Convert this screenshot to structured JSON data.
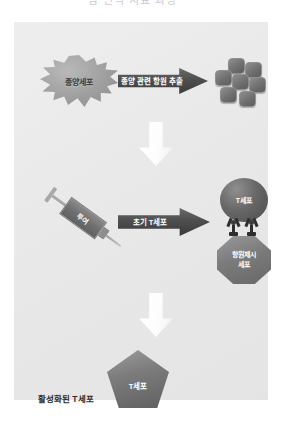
{
  "title_strip": {
    "text": "암 면역 치료 과정"
  },
  "diagram": {
    "stage1": {
      "tumor_cell_label": "종양세포",
      "arrow_label": "종양 관련 항원 추출",
      "antigen_cluster_name": "antigen-particles",
      "antigen_particle_count": 7
    },
    "connector1": {
      "icon": "down-arrow-icon"
    },
    "stage2": {
      "syringe_label": "투여",
      "arrow_label": "초기 T세포",
      "tcell_label": "T세포",
      "apc_label_line1": "항원제시",
      "apc_label_line2": "세포"
    },
    "connector2": {
      "icon": "down-arrow-icon"
    },
    "stage3": {
      "tcell_label": "T세포",
      "caption": "활성화된 T세포"
    }
  },
  "colors": {
    "panel_background": "#e9e9e9",
    "arrow_dark": "#4e4e4e",
    "cell_gray": "#6d6d6d",
    "down_arrow_white": "#ffffff",
    "text_dark": "#2d2d2d",
    "text_light": "#ffffff"
  }
}
